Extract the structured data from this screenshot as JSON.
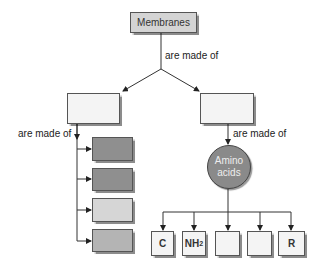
{
  "title_node": {
    "label": "Membranes",
    "fill": "#d4d4d4"
  },
  "edges": {
    "top_label": "are made of",
    "left_label": "are made of",
    "right_label": "are made of"
  },
  "level2": {
    "left_box": {
      "label": "",
      "fill": "#f4f4f4"
    },
    "right_box": {
      "label": "",
      "fill": "#f4f4f4"
    }
  },
  "left_components": [
    {
      "label": "",
      "fill": "#8f8f8f"
    },
    {
      "label": "",
      "fill": "#8f8f8f"
    },
    {
      "label": "",
      "fill": "#d6d6d6"
    },
    {
      "label": "",
      "fill": "#b4b4b4"
    }
  ],
  "amino_acids": {
    "line1": "Amino",
    "line2": "acids",
    "fill": "#8a8a8a"
  },
  "amino_components": [
    {
      "label": "C"
    },
    {
      "label": "NH",
      "sub": "2"
    },
    {
      "label": ""
    },
    {
      "label": ""
    },
    {
      "label": "R"
    }
  ],
  "colors": {
    "line": "#333333",
    "box_light": "#f4f4f4"
  }
}
